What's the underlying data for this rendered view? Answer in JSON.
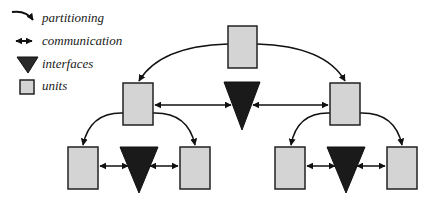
{
  "legend": {
    "items": [
      {
        "icon": "partitioning-arrow-icon",
        "label": "partitioning"
      },
      {
        "icon": "double-arrow-icon",
        "label": "communication"
      },
      {
        "icon": "triangle-icon",
        "label": "interfaces"
      },
      {
        "icon": "square-icon",
        "label": "units"
      }
    ]
  },
  "colors": {
    "unit_fill": "#d4d4d4",
    "unit_stroke": "#222222",
    "interface_fill": "#1a1a1a",
    "line": "#111111",
    "background": "#ffffff"
  },
  "diagram": {
    "levels": 3,
    "nodes": [
      {
        "id": "root",
        "type": "unit"
      },
      {
        "id": "mid-left",
        "type": "unit"
      },
      {
        "id": "mid-interface",
        "type": "interface"
      },
      {
        "id": "mid-right",
        "type": "unit"
      },
      {
        "id": "bl-left",
        "type": "unit"
      },
      {
        "id": "bl-interface",
        "type": "interface"
      },
      {
        "id": "bl-right",
        "type": "unit"
      },
      {
        "id": "br-left",
        "type": "unit"
      },
      {
        "id": "br-interface",
        "type": "interface"
      },
      {
        "id": "br-right",
        "type": "unit"
      }
    ],
    "partitioning_edges": [
      [
        "root",
        "mid-left"
      ],
      [
        "root",
        "mid-right"
      ],
      [
        "mid-left",
        "bl-left"
      ],
      [
        "mid-left",
        "bl-right"
      ],
      [
        "mid-right",
        "br-left"
      ],
      [
        "mid-right",
        "br-right"
      ]
    ],
    "communication_edges": [
      [
        "mid-left",
        "mid-interface"
      ],
      [
        "mid-interface",
        "mid-right"
      ],
      [
        "bl-left",
        "bl-interface"
      ],
      [
        "bl-interface",
        "bl-right"
      ],
      [
        "br-left",
        "br-interface"
      ],
      [
        "br-interface",
        "br-right"
      ]
    ]
  }
}
